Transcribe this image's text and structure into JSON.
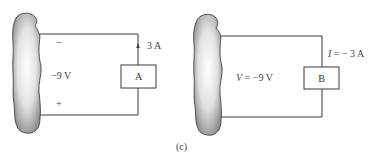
{
  "figure_label": "(c)",
  "left_circuit": {
    "element_label": "A",
    "voltage_label": "−9 V",
    "polarity_top": "−",
    "polarity_bottom": "+",
    "current_label": "3 A",
    "current_arrow": "up"
  },
  "right_circuit": {
    "element_label": "B",
    "voltage_var": "V",
    "voltage_rest": " = −9 V",
    "current_var": "I",
    "current_rest": " = − 3 A"
  },
  "colors": {
    "wire": "#3a3a3a",
    "blob_fill_light": "#f4f4f4",
    "blob_fill_dark": "#8c8c8c",
    "blob_outline": "#333333"
  }
}
